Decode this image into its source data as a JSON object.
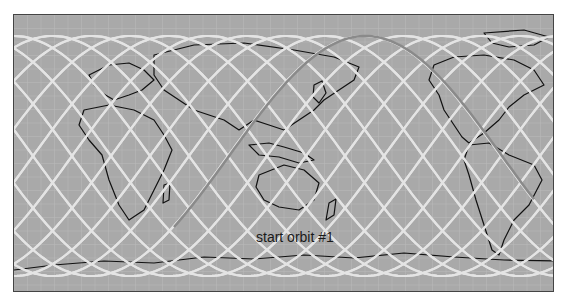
{
  "map": {
    "projection": "equirectangular",
    "ocean_color": "#a9a9a9",
    "grid_color": "#b9b9b9",
    "coast_color": "#111111",
    "track_color": "#e4e4e4",
    "highlight_track_color": "#8a8a8a",
    "track_count": 14,
    "equator_crossing_spacing_px": 39,
    "annotation": "start orbit #1"
  }
}
